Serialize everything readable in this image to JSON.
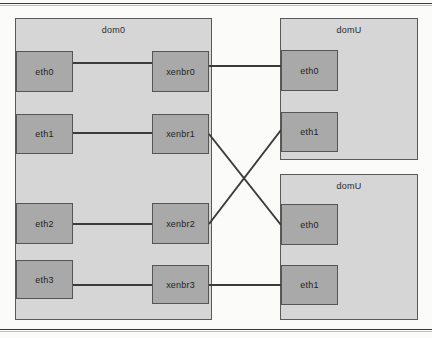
{
  "diagram": {
    "colors": {
      "page_background": "#fbfbfa",
      "container_fill": "#d6d6d6",
      "container_border": "#5a5a5a",
      "nic_fill": "#a9a9a9",
      "nic_border": "#555555",
      "link_stroke": "#3c3c3c",
      "frame_rule": "#3a3a3a"
    },
    "containers": [
      {
        "id": "dom0",
        "label": "dom0",
        "x": 15,
        "y": 18,
        "width": 197,
        "height": 302
      },
      {
        "id": "domU-top",
        "label": "domU",
        "x": 280,
        "y": 18,
        "width": 138,
        "height": 142
      },
      {
        "id": "domU-bottom",
        "label": "domU",
        "x": 280,
        "y": 174,
        "width": 138,
        "height": 146
      }
    ],
    "interfaces": [
      {
        "id": "dom0-eth0",
        "label": "eth0",
        "container": "dom0",
        "x": 16,
        "y": 51,
        "width": 57,
        "height": 41
      },
      {
        "id": "dom0-eth1",
        "label": "eth1",
        "container": "dom0",
        "x": 16,
        "y": 114,
        "width": 57,
        "height": 40
      },
      {
        "id": "dom0-eth2",
        "label": "eth2",
        "container": "dom0",
        "x": 16,
        "y": 203,
        "width": 57,
        "height": 41
      },
      {
        "id": "dom0-eth3",
        "label": "eth3",
        "container": "dom0",
        "x": 16,
        "y": 260,
        "width": 57,
        "height": 39
      },
      {
        "id": "xenbr0",
        "label": "xenbr0",
        "container": "dom0",
        "x": 152,
        "y": 51,
        "width": 57,
        "height": 41
      },
      {
        "id": "xenbr1",
        "label": "xenbr1",
        "container": "dom0",
        "x": 152,
        "y": 114,
        "width": 57,
        "height": 40
      },
      {
        "id": "xenbr2",
        "label": "xenbr2",
        "container": "dom0",
        "x": 152,
        "y": 203,
        "width": 57,
        "height": 41
      },
      {
        "id": "xenbr3",
        "label": "xenbr3",
        "container": "dom0",
        "x": 152,
        "y": 265,
        "width": 57,
        "height": 39
      },
      {
        "id": "domU1-eth0",
        "label": "eth0",
        "container": "domU-top",
        "x": 281,
        "y": 50,
        "width": 57,
        "height": 41
      },
      {
        "id": "domU1-eth1",
        "label": "eth1",
        "container": "domU-top",
        "x": 281,
        "y": 112,
        "width": 57,
        "height": 40
      },
      {
        "id": "domU2-eth0",
        "label": "eth0",
        "container": "domU-bottom",
        "x": 281,
        "y": 204,
        "width": 57,
        "height": 41
      },
      {
        "id": "domU2-eth1",
        "label": "eth1",
        "container": "domU-bottom",
        "x": 281,
        "y": 265,
        "width": 57,
        "height": 40
      }
    ],
    "links": [
      {
        "id": "link-eth0-xenbr0",
        "from": "dom0-eth0",
        "to": "xenbr0",
        "x1": 73,
        "y1": 63,
        "x2": 152,
        "y2": 63
      },
      {
        "id": "link-eth1-xenbr1",
        "from": "dom0-eth1",
        "to": "xenbr1",
        "x1": 73,
        "y1": 133,
        "x2": 152,
        "y2": 133
      },
      {
        "id": "link-eth2-xenbr2",
        "from": "dom0-eth2",
        "to": "xenbr2",
        "x1": 73,
        "y1": 224,
        "x2": 152,
        "y2": 224
      },
      {
        "id": "link-eth3-xenbr3",
        "from": "dom0-eth3",
        "to": "xenbr3",
        "x1": 73,
        "y1": 285,
        "x2": 152,
        "y2": 285
      },
      {
        "id": "link-xenbr0-domU1-eth0",
        "from": "xenbr0",
        "to": "domU1-eth0",
        "x1": 209,
        "y1": 66,
        "x2": 281,
        "y2": 66
      },
      {
        "id": "link-xenbr3-domU2-eth1",
        "from": "xenbr3",
        "to": "domU2-eth1",
        "x1": 209,
        "y1": 285,
        "x2": 281,
        "y2": 285
      },
      {
        "id": "link-xenbr1-domU2-eth0",
        "from": "xenbr1",
        "to": "domU2-eth0",
        "x1": 209,
        "y1": 134,
        "x2": 281,
        "y2": 225
      },
      {
        "id": "link-xenbr2-domU1-eth1",
        "from": "xenbr2",
        "to": "domU1-eth1",
        "x1": 209,
        "y1": 224,
        "x2": 281,
        "y2": 130
      }
    ]
  }
}
